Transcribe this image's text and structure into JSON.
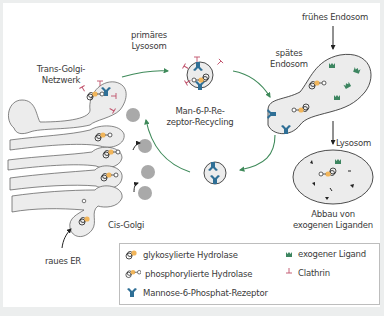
{
  "labels": {
    "trans_golgi": [
      "Trans-Golgi-",
      "Netzwerk"
    ],
    "primary_lysosome": [
      "primäres",
      "Lysosom"
    ],
    "early_endosome": "frühes Endosom",
    "late_endosome": [
      "spätes",
      "Endosom"
    ],
    "receptor_recycling": [
      "Man-6-P-Re-",
      "zeptor-Recycling"
    ],
    "lysosome": "Lysosom",
    "degradation": [
      "Abbau von",
      "exogenen Liganden"
    ],
    "cis_golgi": "Cis-Golgi",
    "rough_er": "raues ER"
  },
  "legend": {
    "items": [
      {
        "icon": "glycosylated-hydrolase-icon",
        "label": "glykosylierte Hydrolase"
      },
      {
        "icon": "phosphorylated-hydrolase-icon",
        "label": "phosphorylierte Hydrolase"
      },
      {
        "icon": "m6p-receptor-icon",
        "label": "Mannose-6-Phosphat-Rezeptor"
      },
      {
        "icon": "exogenous-ligand-icon",
        "label": "exogener Ligand"
      },
      {
        "icon": "clathrin-icon",
        "label": "Clathrin"
      }
    ]
  },
  "colors": {
    "arrow_green": "#3f8a5a",
    "receptor_blue": "#2f6f96",
    "clathrin_red": "#c0506a",
    "hydrolase_orange": "#f1b55a",
    "ligand_green": "#3d8560",
    "vesicle_gray": "#a9a9a9",
    "membrane_fill": "#ececec"
  }
}
